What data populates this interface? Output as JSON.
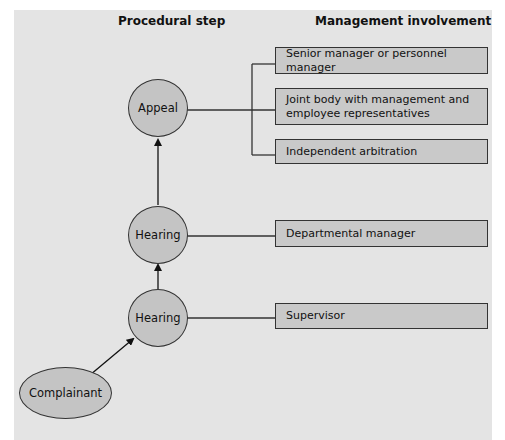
{
  "headers": {
    "procedural_step": "Procedural step",
    "management_involvement": "Management involvement"
  },
  "nodes": [
    {
      "id": "appeal",
      "label": "Appeal"
    },
    {
      "id": "hearing-2",
      "label": "Hearing"
    },
    {
      "id": "hearing-1",
      "label": "Hearing"
    },
    {
      "id": "complainant",
      "label": "Complainant"
    }
  ],
  "management": [
    {
      "label": "Senior manager or personnel manager",
      "linked_to": "appeal"
    },
    {
      "label": "Joint body with management and employee representatives",
      "linked_to": "appeal"
    },
    {
      "label": "Independent arbitration",
      "linked_to": "appeal"
    },
    {
      "label": "Departmental manager",
      "linked_to": "hearing-2"
    },
    {
      "label": "Supervisor",
      "linked_to": "hearing-1"
    }
  ],
  "flow": [
    "Complainant",
    "Hearing",
    "Hearing",
    "Appeal"
  ],
  "colors": {
    "panel": "#e4e4e4",
    "box_fill": "#c9c9c9",
    "node_fill": "#c4c4c4",
    "line": "#333333"
  }
}
